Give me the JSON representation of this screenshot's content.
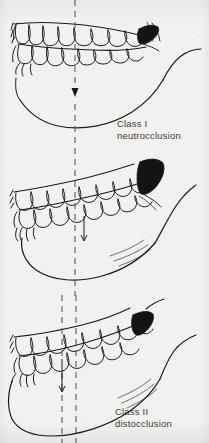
{
  "figure": {
    "background_color": "#f2f1ef",
    "ink_color": "#1a1a1a",
    "caption_color": "#3d3d3d",
    "dash_color": "#5a5a5a"
  },
  "panels": [
    {
      "id": "class-1",
      "caption_line1": "Class I",
      "caption_line2": "neutrocclusion",
      "reference_lines": 1,
      "arrow": "down-arrow",
      "shaded_molar": "dark-molar-shading"
    },
    {
      "id": "class-2",
      "caption_line1": "Class II",
      "caption_line2": "distocclusion",
      "reference_lines": 1,
      "arrow": "down-arrow",
      "shaded_molar": "dark-molar-shading"
    },
    {
      "id": "class-3",
      "caption_line1": "Class III",
      "caption_line2": "mesiocclusion",
      "reference_lines": 2,
      "arrow": "down-arrow",
      "shaded_molar": "dark-molar-shading"
    }
  ]
}
